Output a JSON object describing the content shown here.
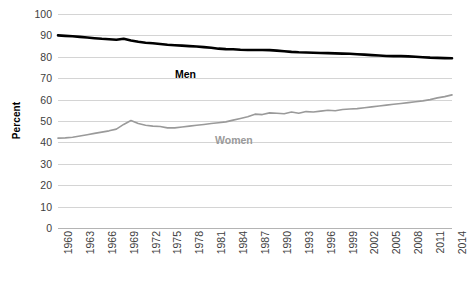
{
  "chart_data": {
    "type": "line",
    "title": "",
    "xlabel": "",
    "ylabel": "Percent",
    "ylim": [
      0,
      100
    ],
    "ytick_step": 10,
    "yticks": [
      100,
      90,
      80,
      70,
      60,
      50,
      40,
      30,
      20,
      10,
      0
    ],
    "xlim": [
      1960,
      2014
    ],
    "xticks": [
      1960,
      1963,
      1966,
      1969,
      1972,
      1975,
      1978,
      1981,
      1984,
      1987,
      1990,
      1993,
      1996,
      1999,
      2002,
      2005,
      2008,
      2011,
      2014
    ],
    "grid": true,
    "legend_position": "inline-annotation",
    "annotations": [
      {
        "text": "Men",
        "series": "Men",
        "color": "#000000",
        "bold": true
      },
      {
        "text": "Women",
        "series": "Women",
        "color": "#9a9a9a",
        "bold": true
      }
    ],
    "x": [
      1960,
      1961,
      1962,
      1963,
      1964,
      1965,
      1966,
      1967,
      1968,
      1969,
      1970,
      1971,
      1972,
      1973,
      1974,
      1975,
      1976,
      1977,
      1978,
      1979,
      1980,
      1981,
      1982,
      1983,
      1984,
      1985,
      1986,
      1987,
      1988,
      1989,
      1990,
      1991,
      1992,
      1993,
      1994,
      1995,
      1996,
      1997,
      1998,
      1999,
      2000,
      2001,
      2002,
      2003,
      2004,
      2005,
      2006,
      2007,
      2008,
      2009,
      2010,
      2011,
      2012,
      2013,
      2014
    ],
    "series": [
      {
        "name": "Men",
        "color": "#000000",
        "width": 2.6,
        "values": [
          90.0,
          89.8,
          89.6,
          89.3,
          89.0,
          88.7,
          88.4,
          88.2,
          88.0,
          88.4,
          87.6,
          87.0,
          86.6,
          86.3,
          86.0,
          85.6,
          85.4,
          85.2,
          85.0,
          84.8,
          84.5,
          84.2,
          83.8,
          83.6,
          83.5,
          83.3,
          83.2,
          83.2,
          83.2,
          83.1,
          82.9,
          82.6,
          82.3,
          82.1,
          82.0,
          81.9,
          81.8,
          81.7,
          81.6,
          81.5,
          81.4,
          81.2,
          81.0,
          80.8,
          80.6,
          80.4,
          80.3,
          80.3,
          80.2,
          80.0,
          79.8,
          79.6,
          79.5,
          79.4,
          79.3
        ]
      },
      {
        "name": "Women",
        "color": "#9a9a9a",
        "width": 1.6,
        "values": [
          42.0,
          42.1,
          42.4,
          43.0,
          43.6,
          44.2,
          44.8,
          45.4,
          46.2,
          48.4,
          50.2,
          48.8,
          48.0,
          47.6,
          47.4,
          46.8,
          46.8,
          47.2,
          47.6,
          48.0,
          48.4,
          48.8,
          49.2,
          49.6,
          50.4,
          51.2,
          52.0,
          53.2,
          53.0,
          53.8,
          53.6,
          53.4,
          54.2,
          53.6,
          54.4,
          54.2,
          54.6,
          55.0,
          54.8,
          55.4,
          55.6,
          55.8,
          56.2,
          56.6,
          57.0,
          57.4,
          57.8,
          58.2,
          58.6,
          59.0,
          59.4,
          60.0,
          60.8,
          61.4,
          62.2
        ]
      }
    ]
  }
}
